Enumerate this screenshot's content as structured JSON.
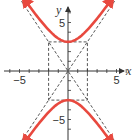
{
  "chart_data": {
    "type": "line",
    "title": "",
    "equation": "y^2/9 - x^2/4 = 1",
    "a": 3,
    "b": 2,
    "xlabel": "x",
    "ylabel": "y",
    "xlim": [
      -6.5,
      6.5
    ],
    "ylim": [
      -7,
      7
    ],
    "x_tick_labels": [
      {
        "value": -5,
        "label": "−5"
      },
      {
        "value": 5,
        "label": "5"
      }
    ],
    "y_tick_labels": [
      {
        "value": 5,
        "label": "5"
      },
      {
        "value": -5,
        "label": "−5"
      }
    ],
    "x_ticks": [
      -6,
      -5,
      -4,
      -3,
      -2,
      -1,
      1,
      2,
      3,
      4,
      5,
      6
    ],
    "y_ticks": [
      -6,
      -5,
      -4,
      -3,
      -2,
      -1,
      1,
      2,
      3,
      4,
      5,
      6
    ],
    "rectangle": {
      "x": [
        -2,
        2
      ],
      "y": [
        -3,
        3
      ],
      "style": "dashed"
    },
    "asymptotes": [
      {
        "name": "asymptote-positive",
        "slope": 1.5,
        "intercept": 0,
        "style": "dashed"
      },
      {
        "name": "asymptote-negative",
        "slope": -1.5,
        "intercept": 0,
        "style": "dashed"
      }
    ],
    "series": [
      {
        "name": "upper-branch",
        "equation": "y = 3*sqrt(1 + x^2/4)",
        "x_range": [
          -4.6,
          4.6
        ],
        "color": "#e8493f"
      },
      {
        "name": "lower-branch",
        "equation": "y = -3*sqrt(1 + x^2/4)",
        "x_range": [
          -4.6,
          4.6
        ],
        "color": "#e8493f"
      }
    ],
    "grid": false,
    "colors": {
      "curve": "#e8493f",
      "axis": "#333333",
      "dash": "#444444"
    }
  }
}
